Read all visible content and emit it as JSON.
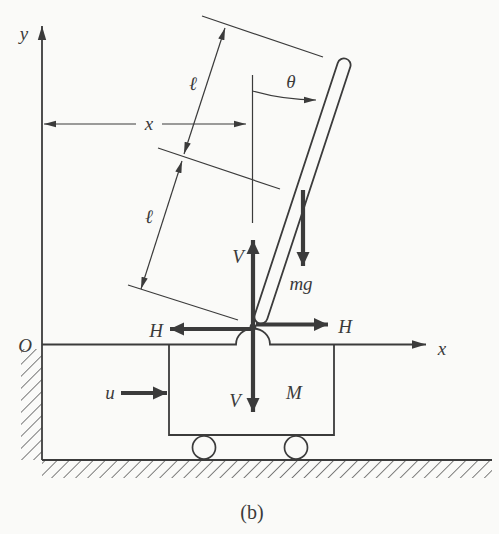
{
  "figure": {
    "caption": "(b)",
    "colors": {
      "ink": "#3b3b3b",
      "paper": "#fafaf8"
    },
    "axes": {
      "y_axis_label": "y",
      "x_axis_label": "x",
      "origin_label": "O"
    },
    "dimensions": {
      "x_displacement_label": "x",
      "upper_half_length_label": "ℓ",
      "lower_half_length_label": "ℓ",
      "angle_label": "θ"
    },
    "forces": {
      "vertical_up_label": "V",
      "vertical_down_label": "V",
      "horizontal_left_label": "H",
      "horizontal_right_label": "H",
      "gravity_label": "mg",
      "input_label": "u"
    },
    "bodies": {
      "cart_mass_label": "M"
    }
  }
}
